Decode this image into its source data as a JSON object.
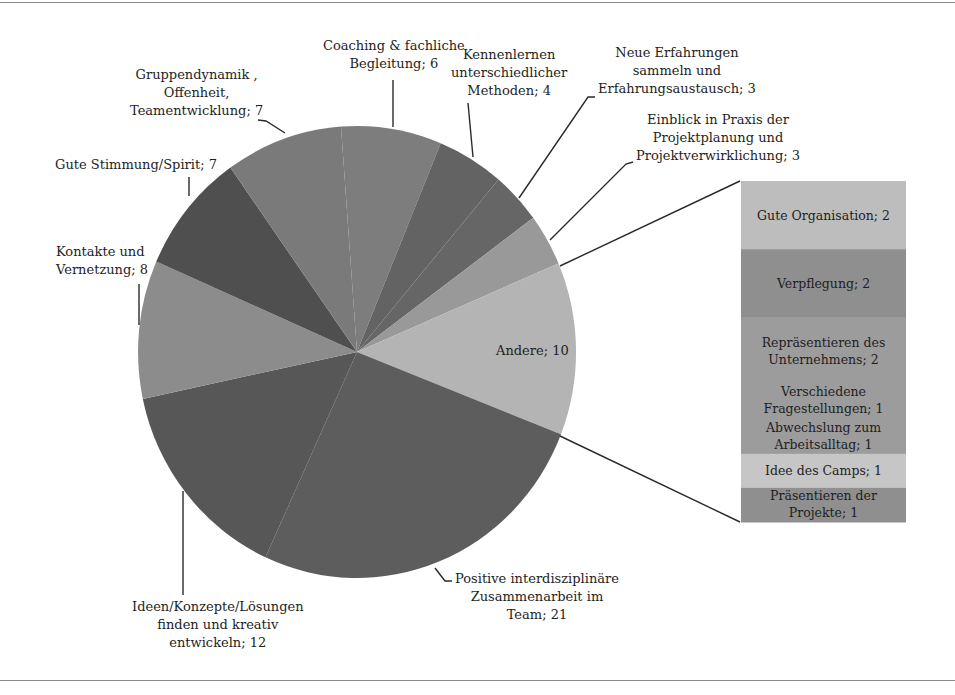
{
  "chart_data": [
    {
      "type": "pie",
      "title": "",
      "start_angle_deg_clockwise_from_top": -4.2,
      "slices": [
        {
          "label": "Coaching & fachliche Begleitung",
          "value": 6,
          "color": "#7d7d7d"
        },
        {
          "label": "Kennenlernen unterschiedlicher Methoden",
          "value": 4,
          "color": "#636363"
        },
        {
          "label": "Neue Erfahrungen sammeln und Erfahrungsaustausch",
          "value": 3,
          "color": "#666666"
        },
        {
          "label": "Einblick in Praxis der Projektplanung und Projektverwirklichung",
          "value": 3,
          "color": "#999999"
        },
        {
          "label": "Andere",
          "value": 10,
          "color": "#b4b4b4"
        },
        {
          "label": "Positive interdisziplinäre Zusammenarbeit im Team",
          "value": 21,
          "color": "#5d5d5d"
        },
        {
          "label": "Ideen/Konzepte/Lösungen finden und kreativ entwickeln",
          "value": 12,
          "color": "#575757"
        },
        {
          "label": "Kontakte und Vernetzung",
          "value": 8,
          "color": "#8c8c8c"
        },
        {
          "label": "Gute Stimmung/Spirit",
          "value": 7,
          "color": "#4f4f4f"
        },
        {
          "label": "Gruppendynamik , Offenheit, Teamentwicklung",
          "value": 7,
          "color": "#7a7a7a"
        }
      ],
      "total": 81
    },
    {
      "type": "bar",
      "stacked": true,
      "title": "Andere (breakdown)",
      "categories": [
        "Andere"
      ],
      "series": [
        {
          "name": "Gute Organisation",
          "values": [
            2
          ],
          "color": "#bdbdbd"
        },
        {
          "name": "Verpflegung",
          "values": [
            2
          ],
          "color": "#8f8f8f"
        },
        {
          "name": "Repräsentieren des Unternehmens",
          "values": [
            2
          ],
          "color": "#9c9c9c"
        },
        {
          "name": "Verschiedene Fragestellungen",
          "values": [
            1
          ],
          "color": "#9c9c9c"
        },
        {
          "name": "Abwechslung zum Arbeitsalltag",
          "values": [
            1
          ],
          "color": "#9c9c9c"
        },
        {
          "name": "Idee des Camps",
          "values": [
            1
          ],
          "color": "#c6c6c6"
        },
        {
          "name": "Präsentieren der Projekte",
          "values": [
            1
          ],
          "color": "#8f8f8f"
        }
      ],
      "total": 10
    }
  ],
  "labels": {
    "coaching": [
      "Coaching & fachliche",
      "Begleitung; 6"
    ],
    "kennenlernen": [
      "Kennenlernen",
      "unterschiedlicher",
      "Methoden; 4"
    ],
    "neue": [
      "Neue Erfahrungen",
      "sammeln und",
      "Erfahrungsaustausch; 3"
    ],
    "einblick": [
      "Einblick in Praxis der",
      "Projektplanung und",
      "Projektverwirklichung; 3"
    ],
    "andere": "Andere; 10",
    "positive": [
      "Positive interdisziplinäre",
      "Zusammenarbeit im",
      "Team; 21"
    ],
    "ideen": [
      "Ideen/Konzepte/Lösungen",
      "finden und kreativ",
      "entwickeln; 12"
    ],
    "kontakte": [
      "Kontakte und",
      "Vernetzung; 8"
    ],
    "stimmung": [
      "Gute Stimmung/Spirit; 7"
    ],
    "gruppen": [
      "Gruppendynamik ,",
      "Offenheit,",
      "Teamentwicklung; 7"
    ]
  },
  "bar_labels": [
    [
      "Gute Organisation; 2"
    ],
    [
      "Verpflegung; 2"
    ],
    [
      "Repräsentieren des",
      "Unternehmens; 2"
    ],
    [
      "Verschiedene",
      "Fragestellungen; 1"
    ],
    [
      "Abwechslung zum",
      "Arbeitsalltag; 1"
    ],
    [
      "Idee des Camps; 1"
    ],
    [
      "Präsentieren der",
      "Projekte; 1"
    ]
  ]
}
